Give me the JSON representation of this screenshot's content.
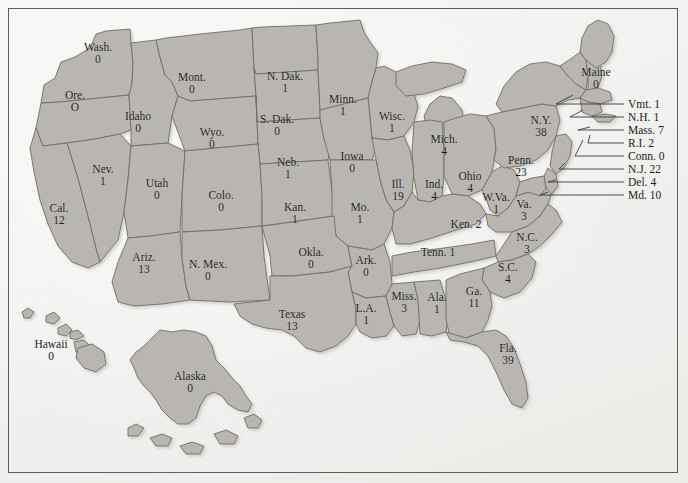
{
  "figure": {
    "type": "choropleth-map",
    "region": "United States",
    "colors": {
      "state_fill": "#b9b6b1",
      "state_stroke": "#6f6d69",
      "background": "#f3f3f1",
      "frame": "#5d5d5a",
      "text": "#1c1c1c",
      "leader_line": "#3a3a38"
    }
  },
  "chart_data": {
    "type": "map",
    "title": "",
    "value_label": "count",
    "states": [
      {
        "name": "Wash.",
        "value": "0",
        "x": 98,
        "y": 53,
        "layout": "stacked"
      },
      {
        "name": "Ore.",
        "value": "O",
        "x": 75,
        "y": 101,
        "layout": "stacked"
      },
      {
        "name": "Idaho",
        "value": "0",
        "x": 138,
        "y": 122,
        "layout": "stacked"
      },
      {
        "name": "Mont.",
        "value": "0",
        "x": 192,
        "y": 83,
        "layout": "stacked"
      },
      {
        "name": "Wyo.",
        "value": "0",
        "x": 212,
        "y": 138,
        "layout": "stacked"
      },
      {
        "name": "N. Dak.",
        "value": "1",
        "x": 285,
        "y": 82,
        "layout": "stacked"
      },
      {
        "name": "S. Dak.",
        "value": "0",
        "x": 277,
        "y": 125,
        "layout": "stacked"
      },
      {
        "name": "Minn.",
        "value": "1",
        "x": 343,
        "y": 105,
        "layout": "stacked"
      },
      {
        "name": "Wisc.",
        "value": "1",
        "x": 392,
        "y": 122,
        "layout": "stacked"
      },
      {
        "name": "Mich.",
        "value": "4",
        "x": 444,
        "y": 145,
        "layout": "stacked"
      },
      {
        "name": "Nev.",
        "value": "1",
        "x": 103,
        "y": 175,
        "layout": "stacked"
      },
      {
        "name": "Utah",
        "value": "0",
        "x": 157,
        "y": 189,
        "layout": "stacked"
      },
      {
        "name": "Colo.",
        "value": "0",
        "x": 221,
        "y": 201,
        "layout": "stacked"
      },
      {
        "name": "Neb.",
        "value": "1",
        "x": 288,
        "y": 168,
        "layout": "stacked"
      },
      {
        "name": "Iowa",
        "value": "0",
        "x": 352,
        "y": 162,
        "layout": "stacked"
      },
      {
        "name": "Ill.",
        "value": "19",
        "x": 398,
        "y": 190,
        "layout": "stacked"
      },
      {
        "name": "Ind.",
        "value": "4",
        "x": 434,
        "y": 190,
        "layout": "stacked"
      },
      {
        "name": "Ohio",
        "value": "4",
        "x": 470,
        "y": 182,
        "layout": "stacked"
      },
      {
        "name": "Cal.",
        "value": "12",
        "x": 59,
        "y": 214,
        "layout": "stacked"
      },
      {
        "name": "Ariz.",
        "value": "13",
        "x": 144,
        "y": 263,
        "layout": "stacked"
      },
      {
        "name": "N. Mex.",
        "value": "0",
        "x": 208,
        "y": 270,
        "layout": "stacked"
      },
      {
        "name": "Kan.",
        "value": "1",
        "x": 295,
        "y": 213,
        "layout": "stacked"
      },
      {
        "name": "Mo.",
        "value": "1",
        "x": 360,
        "y": 213,
        "layout": "stacked"
      },
      {
        "name": "Okla.",
        "value": "0",
        "x": 311,
        "y": 258,
        "layout": "stacked"
      },
      {
        "name": "Ark.",
        "value": "0",
        "x": 366,
        "y": 266,
        "layout": "stacked"
      },
      {
        "name": "Texas",
        "value": "13",
        "x": 292,
        "y": 320,
        "layout": "stacked"
      },
      {
        "name": "L.A.",
        "value": "1",
        "x": 366,
        "y": 314,
        "layout": "stacked"
      },
      {
        "name": "Miss.",
        "value": "3",
        "x": 404,
        "y": 302,
        "layout": "stacked"
      },
      {
        "name": "Ala.",
        "value": "1",
        "x": 437,
        "y": 303,
        "layout": "stacked"
      },
      {
        "name": "Ga.",
        "value": "11",
        "x": 474,
        "y": 297,
        "layout": "stacked"
      },
      {
        "name": "Fla.",
        "value": "39",
        "x": 508,
        "y": 354,
        "layout": "stacked"
      },
      {
        "name": "S.C.",
        "value": "4",
        "x": 508,
        "y": 273,
        "layout": "stacked"
      },
      {
        "name": "N.C.",
        "value": "3",
        "x": 527,
        "y": 243,
        "layout": "stacked"
      },
      {
        "name": "Tenn.",
        "value": "1",
        "x": 438,
        "y": 252,
        "layout": "inline"
      },
      {
        "name": "Ken.",
        "value": "2",
        "x": 466,
        "y": 224,
        "layout": "inline"
      },
      {
        "name": "W.Va.",
        "value": "1",
        "x": 496,
        "y": 203,
        "layout": "stacked"
      },
      {
        "name": "Va.",
        "value": "3",
        "x": 524,
        "y": 210,
        "layout": "stacked"
      },
      {
        "name": "Penn.",
        "value": "23",
        "x": 521,
        "y": 166,
        "layout": "stacked"
      },
      {
        "name": "N.Y.",
        "value": "38",
        "x": 541,
        "y": 126,
        "layout": "stacked"
      },
      {
        "name": "Maine",
        "value": "0",
        "x": 596,
        "y": 78,
        "layout": "stacked"
      },
      {
        "name": "Hawaii",
        "value": "0",
        "x": 51,
        "y": 350,
        "layout": "stacked"
      },
      {
        "name": "Alaska",
        "value": "0",
        "x": 190,
        "y": 382,
        "layout": "stacked"
      }
    ],
    "callouts": [
      {
        "name": "Vmt.",
        "value": "1",
        "label_x": 628,
        "label_y": 104,
        "line_x1": 556,
        "line_y1": 104,
        "line_x2": 624,
        "line_y2": 104,
        "anchor_x": 573,
        "anchor_y": 95
      },
      {
        "name": "N.H.",
        "value": "1",
        "label_x": 628,
        "label_y": 117,
        "line_x1": 570,
        "line_y1": 117,
        "line_x2": 624,
        "line_y2": 117,
        "anchor_x": 583,
        "anchor_y": 110
      },
      {
        "name": "Mass.",
        "value": "7",
        "label_x": 628,
        "label_y": 130,
        "line_x1": 578,
        "line_y1": 130,
        "line_x2": 624,
        "line_y2": 130,
        "anchor_x": 590,
        "anchor_y": 127
      },
      {
        "name": "R.I.",
        "value": "2",
        "label_x": 628,
        "label_y": 143,
        "line_x1": 588,
        "line_y1": 143,
        "line_x2": 624,
        "line_y2": 143,
        "anchor_x": 590,
        "anchor_y": 135
      },
      {
        "name": "Conn.",
        "value": "0",
        "label_x": 628,
        "label_y": 156,
        "line_x1": 575,
        "line_y1": 156,
        "line_x2": 624,
        "line_y2": 156,
        "anchor_x": 583,
        "anchor_y": 140
      },
      {
        "name": "N.J.",
        "value": "22",
        "label_x": 628,
        "label_y": 169,
        "line_x1": 559,
        "line_y1": 169,
        "line_x2": 624,
        "line_y2": 169,
        "anchor_x": 565,
        "anchor_y": 163
      },
      {
        "name": "Del.",
        "value": "4",
        "label_x": 628,
        "label_y": 182,
        "line_x1": 548,
        "line_y1": 182,
        "line_x2": 624,
        "line_y2": 182,
        "anchor_x": 556,
        "anchor_y": 180
      },
      {
        "name": "Md.",
        "value": "10",
        "label_x": 628,
        "label_y": 195,
        "line_x1": 540,
        "line_y1": 195,
        "line_x2": 624,
        "line_y2": 195,
        "anchor_x": 548,
        "anchor_y": 192
      }
    ]
  }
}
